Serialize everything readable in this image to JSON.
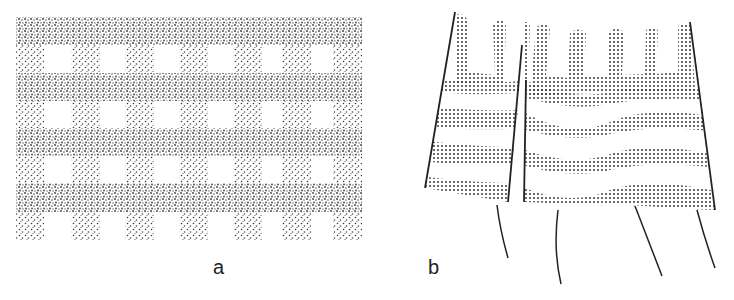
{
  "figure": {
    "panels": [
      {
        "id": "a",
        "label": "a",
        "description": "Stippled woven grid: 7 vertical bands crossing 4 horizontal bands, leaving rectangular open cells",
        "vertical_band_count": 7,
        "horizontal_band_count": 4
      },
      {
        "id": "b",
        "label": "b",
        "description": "Two tapered dotted panels with comb-like fingers at top, four wavy horizontal dotted bands, and hanging threads below",
        "finger_count": 7,
        "wavy_band_count": 4,
        "thread_count": 4
      }
    ]
  },
  "colors": {
    "background": "#ffffff",
    "ink": "#222222",
    "stipple": "#3a3a3a"
  }
}
